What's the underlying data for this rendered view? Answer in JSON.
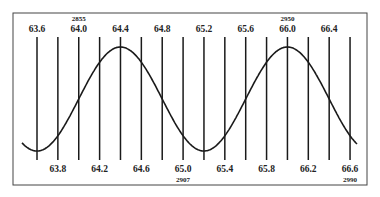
{
  "diagram": {
    "type": "wave-over-scale",
    "frame": {
      "x": 13,
      "y": 13,
      "width": 354,
      "height": 172,
      "stroke": "#444444"
    },
    "colors": {
      "line": "#1a1a1a",
      "curve": "#1a1a1a",
      "text": "#222222",
      "background": "#ffffff"
    },
    "grid": {
      "x_start": 37,
      "spacing": 20.87,
      "count": 16,
      "y_top": 37,
      "y_bottom": 160
    },
    "top_labels": [
      "63.6",
      "64.0",
      "64.4",
      "64.8",
      "65.2",
      "65.6",
      "66.0",
      "66.4"
    ],
    "bottom_labels": [
      "63.8",
      "64.2",
      "64.6",
      "65.0",
      "65.4",
      "65.8",
      "66.2",
      "66.6"
    ],
    "annotations": [
      {
        "text": "2855",
        "position": "above",
        "label": "64.0"
      },
      {
        "text": "2950",
        "position": "above",
        "label": "66.0"
      },
      {
        "text": "2907",
        "position": "below",
        "label": "65.0"
      },
      {
        "text": "2990",
        "position": "below",
        "label": "66.6"
      }
    ],
    "curve": {
      "description": "sinusoidal wave with troughs near 63.6 and 65.2, peaks near 64.4 and 66.0",
      "troughs": [
        "63.6",
        "65.2"
      ],
      "peaks": [
        "64.4",
        "66.0"
      ]
    }
  }
}
